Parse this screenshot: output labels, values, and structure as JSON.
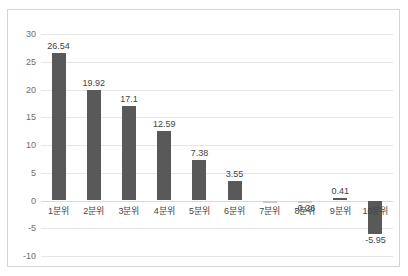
{
  "title_strip": {
    "text": " "
  },
  "chart_data": {
    "type": "bar",
    "title": "",
    "subtitle": "",
    "xlabel": "",
    "ylabel": "",
    "categories": [
      "1분위",
      "2분위",
      "3분위",
      "4분위",
      "5분위",
      "6분위",
      "7분위",
      "8분위",
      "9분위",
      "10분위"
    ],
    "values": [
      26.54,
      19.92,
      17.1,
      12.59,
      7.38,
      3.55,
      0.0,
      -0.26,
      0.41,
      -5.95
    ],
    "value_labels": [
      "26.54",
      "19.92",
      "17.1",
      "12.59",
      "7.38",
      "3.55",
      "",
      "-0.26",
      "0.41",
      "-5.95"
    ],
    "ylim": [
      -10,
      30
    ],
    "yticks": [
      30,
      25,
      20,
      15,
      10,
      5,
      0,
      -5,
      -10
    ],
    "ytick_labels": [
      "30",
      "25",
      "20",
      "15",
      "10",
      "5",
      "0",
      "-5",
      "-10"
    ],
    "grid": true,
    "legend": "none",
    "bar_color": "#595959",
    "grid_color": "#e6e6e6",
    "zero_line_color": "#d9d9d9",
    "border_color": "#d5d5d5",
    "background": "#ffffff"
  }
}
